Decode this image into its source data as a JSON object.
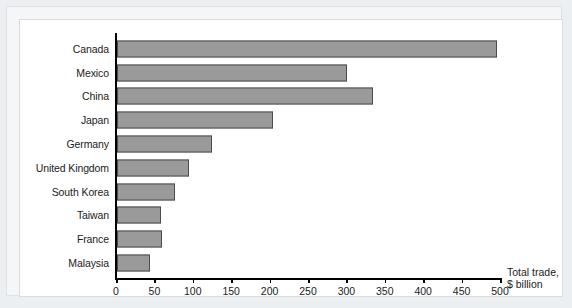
{
  "chart_data": {
    "type": "bar",
    "orientation": "horizontal",
    "title": "",
    "xlabel": "Total trade, $ billion",
    "xlabel_lines": [
      "Total trade,",
      "$ billion"
    ],
    "ylabel": "",
    "categories": [
      "Canada",
      "Mexico",
      "China",
      "Japan",
      "Germany",
      "United Kingdom",
      "South Korea",
      "Taiwan",
      "France",
      "Malaysia"
    ],
    "values": [
      495,
      300,
      333,
      203,
      124,
      94,
      76,
      57,
      59,
      43
    ],
    "xlim": [
      0,
      500
    ],
    "xticks": [
      0,
      50,
      100,
      150,
      200,
      250,
      300,
      350,
      400,
      450,
      500
    ],
    "xtick_labels": [
      "0",
      "50",
      "100",
      "150",
      "200",
      "250",
      "300",
      "350",
      "400",
      "450",
      "500"
    ],
    "grid": false,
    "legend": null,
    "bar_color": "#9a9a9a",
    "bar_edge_color": "#4b4b4b",
    "axis_color": "#000000",
    "panel_background": "#ffffff",
    "page_background": "#eceff1"
  }
}
